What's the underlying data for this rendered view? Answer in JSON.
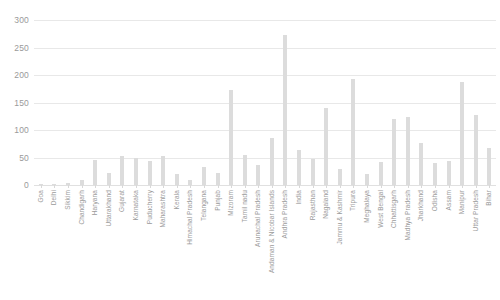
{
  "chart_data": {
    "type": "bar",
    "title": "",
    "xlabel": "",
    "ylabel": "",
    "ylim": [
      0,
      300
    ],
    "ytick_values": [
      300,
      250,
      200,
      150,
      100,
      50,
      0
    ],
    "ytick_labels": [
      "300",
      "250",
      "200",
      "150",
      "100",
      "50",
      "0"
    ],
    "grid": true,
    "legend": "none",
    "bar_color": "#dcdcdc",
    "gridline_color": "#e8e8e8",
    "tick_label_color": "#9a9a9a",
    "categories": [
      "Goa",
      "Delhi",
      "Sikkim",
      "Chandigarh",
      "Haryana",
      "Uttarakhand",
      "Gujarat",
      "Karnataka",
      "Puducherry",
      "Maharashtra",
      "Kerala",
      "Himachal Pradesh",
      "Telangana",
      "Punjab",
      "Mizoram",
      "Tamil nadu",
      "Arunachal Pradesh",
      "Andaman & Nicobar Islands",
      "Andhra Pradesh",
      "India",
      "Rajasthan",
      "Nagaland",
      "Jammu & Kashmir",
      "Tripura",
      "Meghalaya",
      "West Bengal",
      "Chhattisgarh",
      "Madhya Pradesh",
      "Jharkhand",
      "Odisha",
      "Assam",
      "Manipur",
      "Uttar Pradesh",
      "Bihar"
    ],
    "values": [
      1,
      2,
      3,
      9,
      46,
      21,
      53,
      50,
      43,
      53,
      20,
      9,
      32,
      21,
      172,
      55,
      36,
      85,
      272,
      64,
      47,
      140,
      30,
      193,
      20,
      42,
      120,
      124,
      77,
      40,
      44,
      187,
      128,
      68
    ]
  }
}
